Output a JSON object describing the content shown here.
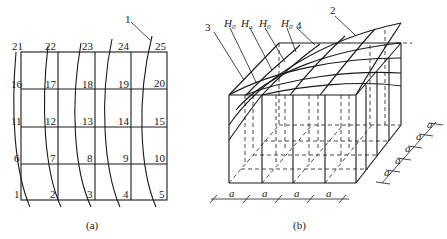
{
  "figure_a": {
    "caption": "(a)",
    "callout": "1",
    "grid_nodes": [
      [
        "21",
        "22",
        "23",
        "24",
        "25"
      ],
      [
        "16",
        "17",
        "18",
        "19",
        "20"
      ],
      [
        "11",
        "12",
        "13",
        "14",
        "15"
      ],
      [
        "6",
        "7",
        "8",
        "9",
        "10"
      ],
      [
        "1",
        "2",
        "3",
        "4",
        "5"
      ]
    ]
  },
  "figure_b": {
    "caption": "(b)",
    "callouts": {
      "c2": "2",
      "c3": "3",
      "c4": "4"
    },
    "h_labels": [
      {
        "base": "H",
        "sub": "0"
      },
      {
        "base": "H",
        "sub": "a"
      },
      {
        "base": "H",
        "sub": "0"
      },
      {
        "base": "H",
        "sub": "0"
      }
    ],
    "dim_bottom": [
      "a",
      "a",
      "a",
      "a"
    ],
    "dim_side": [
      "a",
      "a",
      "a",
      "a",
      "a"
    ]
  }
}
